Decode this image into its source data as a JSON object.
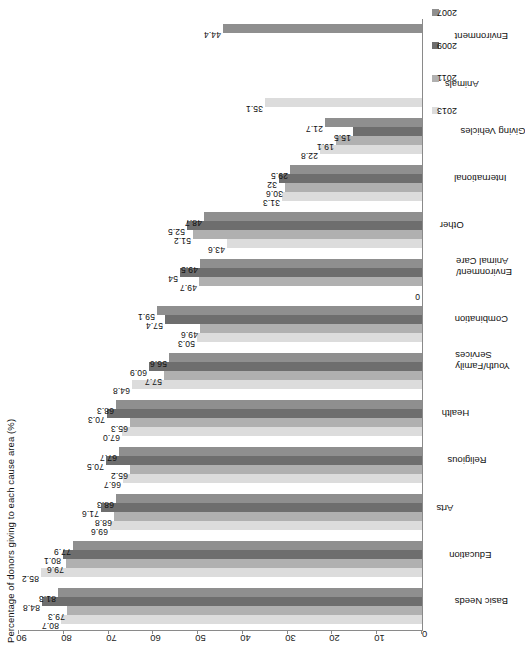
{
  "chart_data": {
    "type": "bar",
    "title": "Percentage of donors giving to each cause area (%)",
    "xlabel": "",
    "ylabel": "",
    "ylim": [
      0,
      90
    ],
    "yticks": [
      0,
      10,
      20,
      30,
      40,
      50,
      60,
      70,
      80,
      90
    ],
    "grid": false,
    "legend_position": "right",
    "orientation": "page-rotated-90",
    "categories": [
      "Basic Needs",
      "Education",
      "Arts",
      "Religious",
      "Health",
      "Youth/Family\nServices",
      "Combination",
      "Environment/\nAnimal Care",
      "Other",
      "International",
      "Giving Vehicles",
      "Animals",
      "Environment"
    ],
    "series": [
      {
        "name": "2013",
        "color": "#dcdcdc",
        "values": [
          80.7,
          85.2,
          69.6,
          66.7,
          67.0,
          64.8,
          50.3,
          0,
          43.6,
          31.3,
          22.8,
          35.1,
          null
        ]
      },
      {
        "name": "2011",
        "color": "#b0b0b0",
        "values": [
          79.3,
          79.6,
          68.8,
          65.2,
          65.3,
          57.7,
          49.6,
          49.7,
          51.2,
          30.6,
          19.1,
          null,
          null
        ]
      },
      {
        "name": "2009",
        "color": "#6e6e6e",
        "values": [
          84.8,
          80.1,
          71.6,
          70.5,
          70.3,
          60.9,
          57.4,
          54.0,
          52.5,
          32.0,
          15.5,
          null,
          null
        ]
      },
      {
        "name": "2007",
        "color": "#8f8f8f",
        "values": [
          81.3,
          77.9,
          68.3,
          67.7,
          68.3,
          56.6,
          59.1,
          49.5,
          48.7,
          29.5,
          21.7,
          null,
          44.4
        ]
      }
    ],
    "value_labels": {
      "Basic Needs": [
        "80.7",
        "79.3",
        "84.8",
        "81.3"
      ],
      "Education": [
        "85.2",
        "79.6",
        "80.1",
        "77.9"
      ],
      "Arts": [
        "69.6",
        "68.8",
        "71.6",
        "68.3"
      ],
      "Religious": [
        "66.7",
        "65.2",
        "70.5",
        "67.7"
      ],
      "Health": [
        "67.0",
        "65.3",
        "70.3",
        "68.3"
      ],
      "Youth/Family Services": [
        "64.8",
        "57.7",
        "60.9",
        "56.6"
      ],
      "Combination": [
        "50.3",
        "49.6",
        "57.4",
        "59.1"
      ],
      "Environment/Animal Care": [
        "0",
        "49.7",
        "54",
        "49.5"
      ],
      "Other": [
        "43.6",
        "51.2",
        "52.5",
        "48.7"
      ],
      "International": [
        "31.3",
        "30.6",
        "32",
        "29.5"
      ],
      "Giving Vehicles": [
        "22.8",
        "19.1",
        "15.5",
        "21.7"
      ],
      "Animals": [
        "35.1"
      ],
      "Environment": [
        "44.4"
      ]
    }
  },
  "legend": {
    "items": [
      {
        "label": "2013",
        "color": "#dcdcdc"
      },
      {
        "label": "2011",
        "color": "#b0b0b0"
      },
      {
        "label": "2009",
        "color": "#6e6e6e"
      },
      {
        "label": "2007",
        "color": "#8f8f8f"
      }
    ]
  },
  "axis": {
    "tick_0": "0",
    "tick_10": "10",
    "tick_20": "20",
    "tick_30": "30",
    "tick_40": "40",
    "tick_50": "50",
    "tick_60": "60",
    "tick_70": "70",
    "tick_80": "80",
    "tick_90": "90"
  }
}
